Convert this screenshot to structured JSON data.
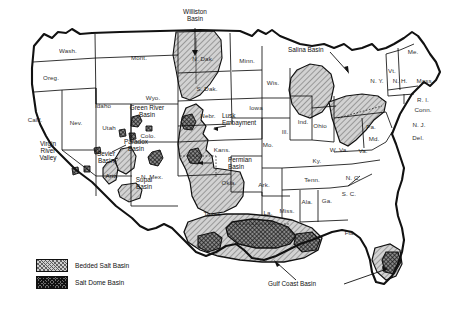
{
  "figure": {
    "background_color": "#ffffff",
    "line_color": "#111111",
    "caption": ""
  },
  "legend": {
    "items": [
      {
        "label": "Bedded Salt Basin",
        "pattern": "light-diagonal-hatch",
        "color": "#cfcfcf"
      },
      {
        "label": "Salt Dome Basin",
        "pattern": "dark-crosshatch",
        "color": "#6e6e6e"
      }
    ]
  },
  "basin_labels": [
    {
      "name": "williston-basin",
      "text": "Williston\nBasin",
      "x": 195,
      "y": 14,
      "leader": true
    },
    {
      "name": "green-river-basin",
      "text": "Green River\nBasin",
      "x": 147,
      "y": 110,
      "leader": false
    },
    {
      "name": "paradox-basin",
      "text": "Paradox\nBasin",
      "x": 136,
      "y": 144,
      "leader": false
    },
    {
      "name": "sevier-basin",
      "text": "Sevier\nBasin",
      "x": 108,
      "y": 155,
      "leader": true
    },
    {
      "name": "virgin-river-valley",
      "text": "Virgin\nRiver\nValley",
      "x": 80,
      "y": 144,
      "leader": true
    },
    {
      "name": "supai-basin",
      "text": "Supai\nBasin",
      "x": 144,
      "y": 181,
      "leader": false
    },
    {
      "name": "lusk-embayment",
      "text": "Lusk\nEmbayment",
      "x": 196,
      "y": 126,
      "leader": true
    },
    {
      "name": "permian-basin",
      "text": "Permian\nBasin",
      "x": 222,
      "y": 163,
      "leader": true
    },
    {
      "name": "salina-basin",
      "text": "Salina Basin",
      "x": 338,
      "y": 49,
      "leader": true
    },
    {
      "name": "gulf-coast-basin",
      "text": "Gulf Coast Basin",
      "x": 303,
      "y": 284,
      "leader": true
    }
  ],
  "state_labels": [
    {
      "abbr": "Wash.",
      "x": 68,
      "y": 48
    },
    {
      "abbr": "Oreg.",
      "x": 51,
      "y": 75
    },
    {
      "abbr": "Calif.",
      "x": 35,
      "y": 117
    },
    {
      "abbr": "Nev.",
      "x": 76,
      "y": 120
    },
    {
      "abbr": "Idaho",
      "x": 103,
      "y": 103
    },
    {
      "abbr": "Mont.",
      "x": 139,
      "y": 55
    },
    {
      "abbr": "Wyo.",
      "x": 153,
      "y": 95
    },
    {
      "abbr": "Utah",
      "x": 109,
      "y": 125
    },
    {
      "abbr": "Colo.",
      "x": 148,
      "y": 133
    },
    {
      "abbr": "Ariz.",
      "x": 112,
      "y": 173
    },
    {
      "abbr": "N. Mex.",
      "x": 152,
      "y": 174
    },
    {
      "abbr": "N. Dak.",
      "x": 203,
      "y": 56
    },
    {
      "abbr": "S. Dak.",
      "x": 207,
      "y": 86
    },
    {
      "abbr": "Nebr.",
      "x": 208,
      "y": 113
    },
    {
      "abbr": "Kans.",
      "x": 222,
      "y": 147
    },
    {
      "abbr": "Okla.",
      "x": 229,
      "y": 180
    },
    {
      "abbr": "Texas",
      "x": 212,
      "y": 211
    },
    {
      "abbr": "Minn.",
      "x": 247,
      "y": 58
    },
    {
      "abbr": "Iowa",
      "x": 256,
      "y": 105
    },
    {
      "abbr": "Mo.",
      "x": 268,
      "y": 142
    },
    {
      "abbr": "Ark.",
      "x": 264,
      "y": 182
    },
    {
      "abbr": "La.",
      "x": 268,
      "y": 210
    },
    {
      "abbr": "Wis.",
      "x": 273,
      "y": 80
    },
    {
      "abbr": "Ill.",
      "x": 285,
      "y": 129
    },
    {
      "abbr": "Miss.",
      "x": 287,
      "y": 208
    },
    {
      "abbr": "Ind.",
      "x": 303,
      "y": 119
    },
    {
      "abbr": "Ohio",
      "x": 320,
      "y": 123
    },
    {
      "abbr": "Ky.",
      "x": 317,
      "y": 158
    },
    {
      "abbr": "Tenn.",
      "x": 312,
      "y": 177
    },
    {
      "abbr": "Ala.",
      "x": 307,
      "y": 199
    },
    {
      "abbr": "Ga.",
      "x": 327,
      "y": 198
    },
    {
      "abbr": "Fla.",
      "x": 350,
      "y": 230
    },
    {
      "abbr": "S. C.",
      "x": 349,
      "y": 191
    },
    {
      "abbr": "N. C.",
      "x": 353,
      "y": 175
    },
    {
      "abbr": "W. Va.",
      "x": 339,
      "y": 147
    },
    {
      "abbr": "Va.",
      "x": 363,
      "y": 148
    },
    {
      "abbr": "Pa.",
      "x": 371,
      "y": 124
    },
    {
      "abbr": "Md.",
      "x": 374,
      "y": 136
    },
    {
      "abbr": "N. Y.",
      "x": 377,
      "y": 78
    },
    {
      "abbr": "Vt.",
      "x": 392,
      "y": 68
    },
    {
      "abbr": "N. H.",
      "x": 400,
      "y": 78
    },
    {
      "abbr": "Me.",
      "x": 413,
      "y": 49
    },
    {
      "abbr": "Mass.",
      "x": 425,
      "y": 78
    },
    {
      "abbr": "R. I.",
      "x": 423,
      "y": 97
    },
    {
      "abbr": "Conn.",
      "x": 423,
      "y": 107
    },
    {
      "abbr": "N. J.",
      "x": 419,
      "y": 122
    },
    {
      "abbr": "Del.",
      "x": 418,
      "y": 135
    }
  ]
}
